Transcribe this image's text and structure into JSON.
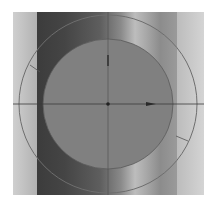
{
  "viewport": {
    "description": "3D viewport with cylinder and rotate gizmo",
    "colors": {
      "background": "#ffffff",
      "panel": "#c4c4c4",
      "disk_fill": "#808080",
      "outer_ring": "#6e6e6e",
      "axis_lines": "#3a3a3a"
    }
  },
  "gizmo": {
    "center": [
      108,
      104
    ],
    "outer_radius": 89,
    "disk_radius": 65,
    "icons": [
      "rotate-gizmo-icon",
      "center-dot-icon",
      "arrow-right-icon"
    ]
  }
}
